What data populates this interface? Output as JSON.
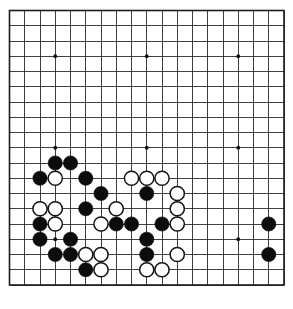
{
  "board": {
    "title": "Go board position",
    "size": 19,
    "origin_x": 9.5,
    "origin_y": 10.5,
    "spacing": 15.25,
    "line_color": "#2a2a2a",
    "frame_color": "#1c1c1c",
    "background_color": "#ffffff",
    "black_color": "#0c0c0c",
    "white_color": "#ffffff",
    "white_edge_color": "#131313",
    "stone_radius": 7.1,
    "star_radius": 1.9,
    "star_points": [
      {
        "col": 3,
        "row": 3
      },
      {
        "col": 9,
        "row": 3
      },
      {
        "col": 15,
        "row": 3
      },
      {
        "col": 3,
        "row": 9
      },
      {
        "col": 9,
        "row": 9
      },
      {
        "col": 15,
        "row": 9
      },
      {
        "col": 3,
        "row": 15
      },
      {
        "col": 9,
        "row": 15
      },
      {
        "col": 15,
        "row": 15
      }
    ],
    "column_labels": [
      "A",
      "B",
      "C",
      "D",
      "E",
      "F",
      "G",
      "H",
      "J",
      "K",
      "L",
      "M",
      "N",
      "O",
      "P",
      "Q",
      "R",
      "S",
      "T"
    ],
    "black_stones": [
      {
        "col": 3,
        "row": 10
      },
      {
        "col": 4,
        "row": 10
      },
      {
        "col": 2,
        "row": 11
      },
      {
        "col": 5,
        "row": 11
      },
      {
        "col": 6,
        "row": 12
      },
      {
        "col": 9,
        "row": 12
      },
      {
        "col": 5,
        "row": 13
      },
      {
        "col": 2,
        "row": 14
      },
      {
        "col": 7,
        "row": 14
      },
      {
        "col": 8,
        "row": 14
      },
      {
        "col": 10,
        "row": 14
      },
      {
        "col": 2,
        "row": 15
      },
      {
        "col": 4,
        "row": 15
      },
      {
        "col": 9,
        "row": 15
      },
      {
        "col": 17,
        "row": 14
      },
      {
        "col": 3,
        "row": 16
      },
      {
        "col": 4,
        "row": 16
      },
      {
        "col": 9,
        "row": 16
      },
      {
        "col": 17,
        "row": 16
      },
      {
        "col": 5,
        "row": 17
      }
    ],
    "white_stones": [
      {
        "col": 3,
        "row": 11
      },
      {
        "col": 8,
        "row": 11
      },
      {
        "col": 9,
        "row": 11
      },
      {
        "col": 10,
        "row": 11
      },
      {
        "col": 11,
        "row": 12
      },
      {
        "col": 2,
        "row": 13
      },
      {
        "col": 3,
        "row": 13
      },
      {
        "col": 7,
        "row": 13
      },
      {
        "col": 11,
        "row": 13
      },
      {
        "col": 3,
        "row": 14
      },
      {
        "col": 6,
        "row": 14
      },
      {
        "col": 11,
        "row": 14
      },
      {
        "col": 5,
        "row": 16
      },
      {
        "col": 6,
        "row": 16
      },
      {
        "col": 11,
        "row": 16
      },
      {
        "col": 6,
        "row": 17
      },
      {
        "col": 9,
        "row": 17
      },
      {
        "col": 10,
        "row": 17
      }
    ]
  }
}
